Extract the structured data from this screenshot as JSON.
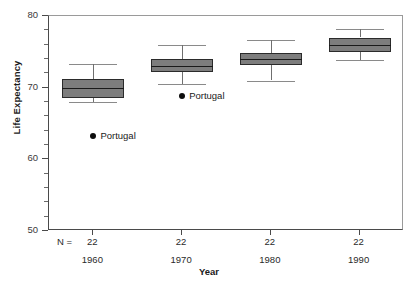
{
  "chart_data": {
    "type": "box",
    "title": "",
    "xlabel": "Year",
    "ylabel": "Life Expectancy",
    "ylim": [
      50,
      80
    ],
    "ytick_labels": [
      "50",
      "60",
      "70",
      "80"
    ],
    "yticks": [
      50,
      60,
      70,
      80
    ],
    "yminor_step": 2,
    "grid": false,
    "legend": "none",
    "group_count_label": "N =",
    "categories": [
      "1960",
      "1970",
      "1980",
      "1990"
    ],
    "counts": [
      "22",
      "22",
      "22",
      "22"
    ],
    "boxes": [
      {
        "category": "1960",
        "n": "22",
        "whisker_low": 68.0,
        "q1": 68.5,
        "median": 70.0,
        "q3": 71.2,
        "whisker_high": 73.3
      },
      {
        "category": "1970",
        "n": "22",
        "whisker_low": 70.5,
        "q1": 72.2,
        "median": 73.0,
        "q3": 74.0,
        "whisker_high": 76.0
      },
      {
        "category": "1980",
        "n": "22",
        "whisker_low": 71.0,
        "q1": 73.2,
        "median": 74.0,
        "q3": 74.8,
        "whisker_high": 76.6
      },
      {
        "category": "1990",
        "n": "22",
        "whisker_low": 73.8,
        "q1": 75.0,
        "median": 76.0,
        "q3": 77.0,
        "whisker_high": 78.2
      }
    ],
    "outliers": [
      {
        "category": "1960",
        "label": "Portugal",
        "value": 63.3
      },
      {
        "category": "1970",
        "label": "Portugal",
        "value": 68.9
      }
    ],
    "colors": {
      "box_fill": "#7d7d7d",
      "box_edge": "#2b2b2b",
      "median": "#1a1a1a",
      "whisker": "#8a8a8a",
      "outlier": "#0d0d0d",
      "axis": "#4a4a4a",
      "background": "#ffffff"
    }
  }
}
